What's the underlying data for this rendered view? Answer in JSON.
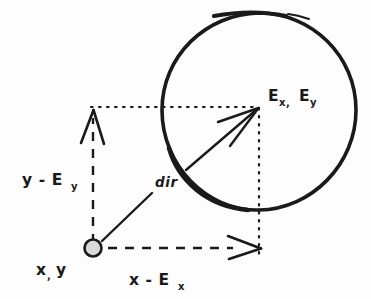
{
  "diagram": {
    "background_color": "#fdfdfd",
    "ink_color": "#1a1a1a",
    "marker_fill_color": "#d9d9d9",
    "labels": {
      "origin_point": {
        "base": "x",
        "comma": ",",
        "second": "y",
        "full": "x, y"
      },
      "target_point": {
        "base_x": "E",
        "sub_x": "x,",
        "base_y": "E",
        "sub_y": "y",
        "full": "E x, E y"
      },
      "vertical_leg": {
        "base": "y  -  E",
        "sub": "y",
        "full": "y - E y"
      },
      "horizontal_leg": {
        "base": "x  -  E",
        "sub": "x",
        "full": "x - E x"
      },
      "diagonal_vector": "dir"
    },
    "elements": {
      "circle_name": "enemy-circle",
      "origin_marker_name": "origin-point-marker",
      "dir_arrow_name": "direction-vector-arrow",
      "vertical_arrow_name": "vertical-component-arrow",
      "horizontal_arrow_name": "horizontal-component-arrow",
      "top_dotted_name": "top-dotted-guide",
      "right_dotted_name": "right-dotted-guide"
    },
    "geometry": {
      "origin_x": 93,
      "origin_y": 248,
      "target_x": 259,
      "target_y": 108,
      "circle_cx": 259,
      "circle_cy": 110,
      "circle_r": 97
    }
  }
}
